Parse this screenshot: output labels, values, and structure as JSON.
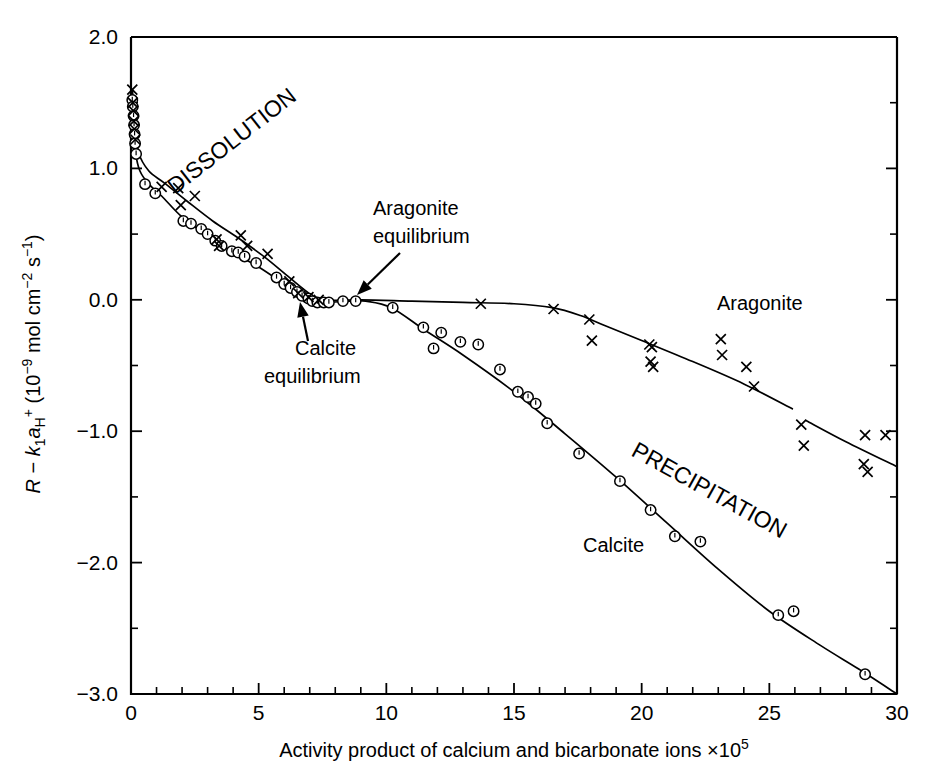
{
  "figure": {
    "background_color": "#ffffff",
    "ink_color": "#000000"
  },
  "chart_data": {
    "type": "scatter",
    "title": "",
    "subtitle": "",
    "xlabel": "Activity product of calcium and bicarbonate ions ×10⁵",
    "ylabel": "R − k₁aₕ⁺ (10⁻⁹ mol cm⁻² s⁻¹)",
    "ylabel_parts": {
      "r": "R",
      "minus": "−",
      "k": "k",
      "k_sub": "1",
      "a": "a",
      "a_sub": "H",
      "a_sup": "+",
      "paren_open": "(10",
      "exp1": "−9",
      "mid": " mol cm",
      "exp2": "−2",
      "s": " s",
      "exp3": "−1",
      "paren_close": ")"
    },
    "xlabel_parts": {
      "main": "Activity product of calcium and bicarbonate ions ×10",
      "exponent": "5"
    },
    "xlim": [
      0,
      30
    ],
    "ylim": [
      -3.0,
      2.0
    ],
    "grid": false,
    "legend_position": "inline-annotations",
    "xticks": [
      0,
      5,
      10,
      15,
      20,
      25,
      30
    ],
    "xtick_labels": [
      "0",
      "5",
      "10",
      "15",
      "20",
      "25",
      "30"
    ],
    "xminor_interval": 1,
    "yticks": [
      2.0,
      1.0,
      0.0,
      -1.0,
      -2.0,
      -3.0
    ],
    "ytick_labels": [
      "2.0",
      "1.0",
      "0.0",
      "−1.0",
      "−2.0",
      "−3.0"
    ],
    "yminor_interval": 0.5,
    "tick_direction": "in",
    "series": [
      {
        "name": "Calcite",
        "marker": "circle",
        "points": [
          [
            0.05,
            1.52
          ],
          [
            0.07,
            1.47
          ],
          [
            0.1,
            1.4
          ],
          [
            0.12,
            1.33
          ],
          [
            0.14,
            1.26
          ],
          [
            0.16,
            1.19
          ],
          [
            0.2,
            1.11
          ],
          [
            0.55,
            0.88
          ],
          [
            0.95,
            0.81
          ],
          [
            2.05,
            0.6
          ],
          [
            2.35,
            0.58
          ],
          [
            2.75,
            0.54
          ],
          [
            3.0,
            0.5
          ],
          [
            3.3,
            0.45
          ],
          [
            3.55,
            0.41
          ],
          [
            3.95,
            0.37
          ],
          [
            4.2,
            0.36
          ],
          [
            4.45,
            0.33
          ],
          [
            4.9,
            0.28
          ],
          [
            5.7,
            0.17
          ],
          [
            6.0,
            0.12
          ],
          [
            6.25,
            0.09
          ],
          [
            6.5,
            0.06
          ],
          [
            6.7,
            0.03
          ],
          [
            6.95,
            0.01
          ],
          [
            7.1,
            -0.01
          ],
          [
            7.3,
            -0.02
          ],
          [
            7.55,
            -0.02
          ],
          [
            7.75,
            -0.02
          ],
          [
            8.3,
            -0.01
          ],
          [
            8.8,
            -0.01
          ],
          [
            10.25,
            -0.06
          ],
          [
            11.45,
            -0.21
          ],
          [
            12.15,
            -0.25
          ],
          [
            11.85,
            -0.37
          ],
          [
            12.9,
            -0.32
          ],
          [
            13.6,
            -0.34
          ],
          [
            14.45,
            -0.53
          ],
          [
            15.15,
            -0.7
          ],
          [
            15.55,
            -0.74
          ],
          [
            15.85,
            -0.79
          ],
          [
            16.3,
            -0.94
          ],
          [
            17.55,
            -1.17
          ],
          [
            19.15,
            -1.38
          ],
          [
            20.35,
            -1.6
          ],
          [
            21.3,
            -1.8
          ],
          [
            22.3,
            -1.84
          ],
          [
            25.35,
            -2.4
          ],
          [
            25.95,
            -2.37
          ],
          [
            28.75,
            -2.85
          ]
        ]
      },
      {
        "name": "Aragonite",
        "marker": "cross",
        "points": [
          [
            0.05,
            1.6
          ],
          [
            0.07,
            1.5
          ],
          [
            0.09,
            1.44
          ],
          [
            0.11,
            1.36
          ],
          [
            0.13,
            1.3
          ],
          [
            0.17,
            1.22
          ],
          [
            1.2,
            0.86
          ],
          [
            1.85,
            0.85
          ],
          [
            2.5,
            0.79
          ],
          [
            1.95,
            0.72
          ],
          [
            3.35,
            0.46
          ],
          [
            3.45,
            0.41
          ],
          [
            4.3,
            0.49
          ],
          [
            4.55,
            0.41
          ],
          [
            5.35,
            0.35
          ],
          [
            6.2,
            0.14
          ],
          [
            6.55,
            0.05
          ],
          [
            6.95,
            0.02
          ],
          [
            7.35,
            0.0
          ],
          [
            13.7,
            -0.03
          ],
          [
            16.55,
            -0.07
          ],
          [
            17.95,
            -0.15
          ],
          [
            18.05,
            -0.31
          ],
          [
            20.3,
            -0.34
          ],
          [
            20.4,
            -0.36
          ],
          [
            20.35,
            -0.47
          ],
          [
            20.45,
            -0.51
          ],
          [
            23.1,
            -0.3
          ],
          [
            23.15,
            -0.42
          ],
          [
            24.1,
            -0.51
          ],
          [
            24.4,
            -0.66
          ],
          [
            26.25,
            -0.95
          ],
          [
            26.35,
            -1.11
          ],
          [
            28.75,
            -1.03
          ],
          [
            29.55,
            -1.03
          ],
          [
            28.7,
            -1.25
          ],
          [
            28.85,
            -1.31
          ]
        ]
      }
    ],
    "curves": [
      {
        "name": "calcite-curve",
        "points": [
          [
            0.05,
            1.6
          ],
          [
            0.1,
            1.35
          ],
          [
            0.18,
            1.12
          ],
          [
            0.35,
            0.98
          ],
          [
            0.7,
            0.88
          ],
          [
            1.2,
            0.79
          ],
          [
            2.0,
            0.63
          ],
          [
            3.0,
            0.49
          ],
          [
            4.0,
            0.36
          ],
          [
            5.0,
            0.25
          ],
          [
            6.0,
            0.12
          ],
          [
            6.6,
            0.04
          ],
          [
            7.0,
            0.0
          ],
          [
            7.6,
            -0.02
          ],
          [
            8.5,
            -0.01
          ],
          [
            9.2,
            -0.01
          ],
          [
            10.2,
            -0.06
          ],
          [
            11.5,
            -0.23
          ],
          [
            13.0,
            -0.42
          ],
          [
            15.0,
            -0.7
          ],
          [
            17.0,
            -1.02
          ],
          [
            19.0,
            -1.35
          ],
          [
            21.0,
            -1.7
          ],
          [
            23.0,
            -2.05
          ],
          [
            25.0,
            -2.37
          ],
          [
            27.0,
            -2.63
          ],
          [
            28.5,
            -2.81
          ],
          [
            30.0,
            -3.0
          ]
        ]
      },
      {
        "name": "aragonite-curve",
        "points": [
          [
            0.05,
            1.6
          ],
          [
            0.12,
            1.38
          ],
          [
            0.3,
            1.12
          ],
          [
            0.7,
            0.98
          ],
          [
            1.3,
            0.89
          ],
          [
            2.2,
            0.75
          ],
          [
            3.2,
            0.6
          ],
          [
            4.2,
            0.47
          ],
          [
            5.2,
            0.33
          ],
          [
            6.2,
            0.17
          ],
          [
            6.9,
            0.06
          ],
          [
            7.4,
            0.0
          ],
          [
            9.0,
            0.0
          ],
          [
            11.0,
            -0.01
          ],
          [
            13.0,
            -0.02
          ],
          [
            15.0,
            -0.03
          ],
          [
            16.5,
            -0.06
          ],
          [
            17.6,
            -0.12
          ],
          [
            18.6,
            -0.2
          ],
          [
            20.0,
            -0.31
          ],
          [
            22.0,
            -0.47
          ],
          [
            24.0,
            -0.64
          ],
          [
            25.9,
            -0.83
          ]
        ]
      },
      {
        "name": "aragonite-curve-segment-2",
        "points": [
          [
            26.45,
            -0.92
          ],
          [
            28.0,
            -1.08
          ],
          [
            30.0,
            -1.27
          ]
        ]
      }
    ],
    "annotations": [
      {
        "name": "dissolution-region-label",
        "text": "DISSOLUTION",
        "x_px": 175,
        "y_px": 195,
        "rotation": -38
      },
      {
        "name": "precipitation-region-label",
        "text": "PRECIPITATION",
        "x_px": 630,
        "y_px": 455,
        "rotation": 29
      },
      {
        "name": "aragonite-series-label",
        "text": "Aragonite",
        "x_px": 717,
        "y_px": 310
      },
      {
        "name": "calcite-series-label",
        "text": "Calcite",
        "x_px": 583,
        "y_px": 552
      },
      {
        "name": "aragonite-equilibrium-label-line1",
        "text": "Aragonite",
        "x_px": 373,
        "y_px": 215
      },
      {
        "name": "aragonite-equilibrium-label-line2",
        "text": "equilibrium",
        "x_px": 373,
        "y_px": 243
      },
      {
        "name": "calcite-equilibrium-label-line1",
        "text": "Calcite",
        "x_px": 295,
        "y_px": 355
      },
      {
        "name": "calcite-equilibrium-label-line2",
        "text": "equilibrium",
        "x_px": 264,
        "y_px": 383
      }
    ],
    "arrows": [
      {
        "name": "aragonite-equilibrium-arrow",
        "from_px": [
          400,
          253
        ],
        "to_px": [
          357,
          295
        ]
      },
      {
        "name": "calcite-equilibrium-arrow",
        "from_px": [
          308,
          341
        ],
        "to_px": [
          300,
          302
        ]
      }
    ]
  }
}
